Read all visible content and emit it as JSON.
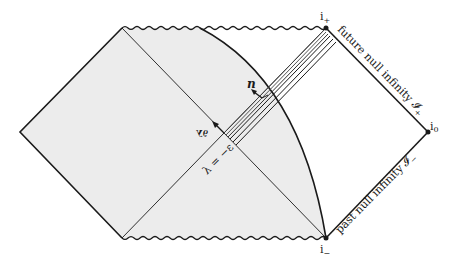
{
  "diagram": {
    "type": "penrose-diagram",
    "colors": {
      "background": "#ffffff",
      "shaded_region": "#ececec",
      "line": "#1a1a1a",
      "band_dark": "#555555"
    },
    "labels": {
      "i_plus": "i",
      "i_plus_sub": "+",
      "i_minus": "i",
      "i_minus_sub": "−",
      "i_zero": "i",
      "i_zero_sub": "0",
      "future_null_infinity": "future null infinity 𝓘",
      "future_null_infinity_sub": "+",
      "past_null_infinity": "past null infinity 𝓘",
      "past_null_infinity_sub": "−",
      "lambda_eq": "λ = −ε",
      "normal_vector": "n",
      "tangent_vector": "∂λ",
      "arrow_label_small": "a"
    }
  }
}
